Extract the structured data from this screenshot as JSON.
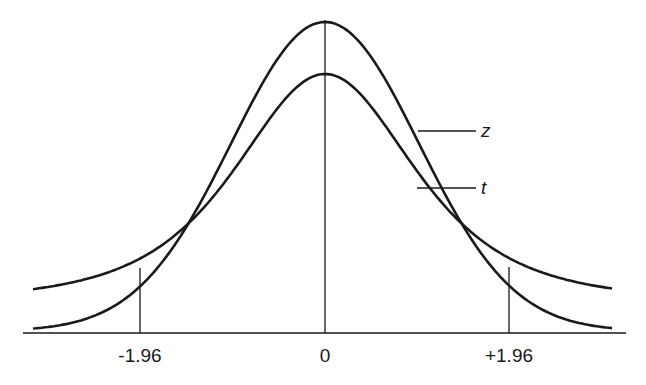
{
  "chart_data": {
    "type": "line",
    "title": "",
    "xlabel": "",
    "ylabel": "",
    "xlim": [
      -3.15,
      3.1
    ],
    "grid": false,
    "legend": "inline labels at right",
    "series": [
      {
        "name": "z",
        "description": "standard normal distribution (taller peak, thinner tails)",
        "peak_y_px": 22,
        "tail_y_px": 325
      },
      {
        "name": "t",
        "description": "Student's t distribution (lower peak, heavier tails)",
        "peak_y_px": 74,
        "tail_y_px": 292
      }
    ],
    "x_ticks": [
      {
        "value": -1.96,
        "label": "-1.96"
      },
      {
        "value": 0,
        "label": "0"
      },
      {
        "value": 1.96,
        "label": "+1.96"
      }
    ],
    "annotations": [
      {
        "text": "z",
        "points_to": "z curve"
      },
      {
        "text": "t",
        "points_to": "t curve"
      }
    ]
  },
  "labels": {
    "tick_neg": "-1.96",
    "tick_zero": "0",
    "tick_pos": "+1.96",
    "z": "z",
    "t": "t"
  },
  "colors": {
    "ink": "#1a1a1a",
    "background": "#ffffff"
  }
}
